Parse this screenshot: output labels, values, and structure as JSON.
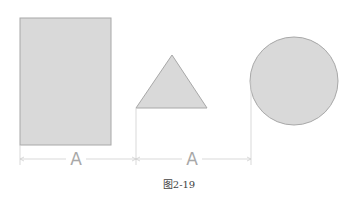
{
  "diagram": {
    "shapes": [
      {
        "type": "rectangle",
        "label": "rectangle"
      },
      {
        "type": "triangle",
        "label": "triangle"
      },
      {
        "type": "circle",
        "label": "circle"
      }
    ],
    "dimension_labels": [
      "A",
      "A"
    ],
    "caption": "图2-19",
    "colors": {
      "fill": "#d9d9d9",
      "stroke": "#a0a0a0",
      "dim_line": "#c8c8c8",
      "label": "#a8a8a8"
    }
  }
}
